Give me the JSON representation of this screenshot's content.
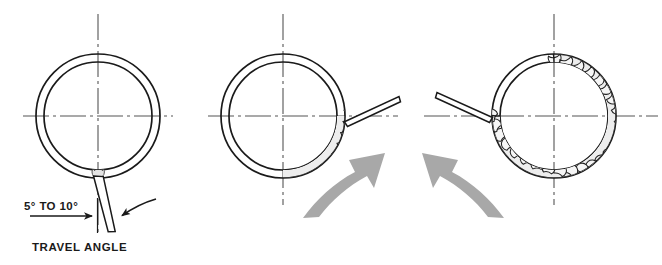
{
  "figure": {
    "background_color": "#ffffff",
    "line_color": "#1a1a1a",
    "centerline_color": "#555555",
    "arrow_fill": "#a8a8a8",
    "bead_fill": "#e8e8e8",
    "panels": [
      {
        "name": "panel-start",
        "center_x": 98,
        "center_y": 116,
        "outer_radius": 62,
        "inner_radius": 54,
        "electrode_angle_deg": 8,
        "electrode_position_oclock": "6",
        "bead_start_deg": 90,
        "bead_end_deg": 90,
        "has_motion_arrow": false,
        "labels": {
          "angle_text": "5° TO 10°",
          "caption_text": "TRAVEL ANGLE"
        }
      },
      {
        "name": "panel-midway",
        "center_x": 283,
        "center_y": 116,
        "outer_radius": 62,
        "inner_radius": 54,
        "electrode_position_oclock": "3",
        "bead_start_deg": 90,
        "bead_end_deg": 0,
        "bead_sweep_deg": 90,
        "has_motion_arrow": true,
        "motion_arrow_direction": "up-right",
        "labels": {}
      },
      {
        "name": "panel-complete",
        "center_x": 554,
        "center_y": 116,
        "outer_radius": 62,
        "inner_radius": 54,
        "electrode_position_oclock": "9",
        "bead_start_deg": 270,
        "bead_end_deg": 180,
        "bead_sweep_deg": 270,
        "has_motion_arrow": true,
        "motion_arrow_direction": "up-left",
        "labels": {}
      }
    ]
  }
}
